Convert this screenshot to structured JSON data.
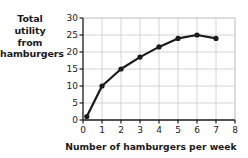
{
  "chart_data": {
    "type": "line",
    "title": "",
    "ylabel": "Total utility from hamburgers",
    "ylabel_lines": [
      "Total",
      "utility",
      "from",
      "hamburgers"
    ],
    "xlabel": "Number of hamburgers per week",
    "xticks": [
      "0",
      "1",
      "2",
      "3",
      "4",
      "5",
      "6",
      "7",
      "8"
    ],
    "yticks": [
      "0",
      "5",
      "10",
      "15",
      "20",
      "25",
      "30"
    ],
    "xlim": [
      0,
      8
    ],
    "ylim": [
      0,
      30
    ],
    "grid": true,
    "legend": "none",
    "marker": "filled-circle",
    "line_color": "#1a1a1a",
    "grid_color": "#c9c9c9",
    "axis_color": "#1a1a1a",
    "x": [
      0.2,
      1,
      2,
      3,
      4,
      5,
      6,
      7
    ],
    "values": [
      1,
      10,
      15,
      18.5,
      21.5,
      24,
      25,
      24
    ],
    "series": [
      {
        "name": "Total utility from hamburgers",
        "points": [
          {
            "x": 0.2,
            "y": 1
          },
          {
            "x": 1,
            "y": 10
          },
          {
            "x": 2,
            "y": 15
          },
          {
            "x": 3,
            "y": 18.5
          },
          {
            "x": 4,
            "y": 21.5
          },
          {
            "x": 5,
            "y": 24
          },
          {
            "x": 6,
            "y": 25
          },
          {
            "x": 7,
            "y": 24
          }
        ]
      }
    ]
  }
}
